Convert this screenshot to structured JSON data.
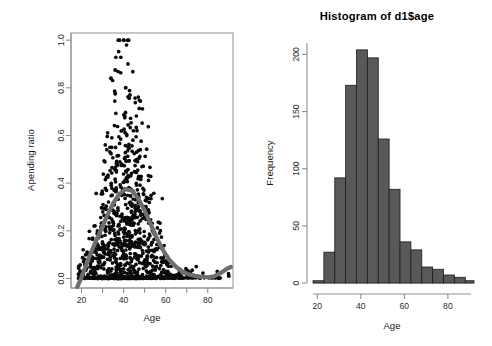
{
  "figure": {
    "width": 492,
    "height": 346,
    "background": "#ffffff",
    "panels": [
      "scatter-plot",
      "histogram"
    ]
  },
  "colors": {
    "point": "#0a0a0a",
    "loess_curve": "#6e6e6e",
    "bar_fill": "#595959",
    "bar_border": "#1c1c1c",
    "axis": "#8f8f8f",
    "text": "#1a1a1a"
  },
  "chart_data": [
    {
      "id": "scatter-plot",
      "type": "scatter",
      "title": "",
      "xlabel": "Age",
      "ylabel": "Apending ratio",
      "xlim": [
        15,
        92
      ],
      "ylim": [
        -0.04,
        1.03
      ],
      "xticks": [
        20,
        40,
        60,
        80
      ],
      "xminorticks": [
        30,
        50,
        70
      ],
      "yticks": [
        0.0,
        0.2,
        0.4,
        0.6,
        0.8,
        1.0
      ],
      "ytick_labels": [
        "0.0",
        "0.2",
        "0.4",
        "0.6",
        "0.8",
        "1.0"
      ],
      "grid": false,
      "legend": "none",
      "frame": "box",
      "n_points": 1100,
      "point_symbol": "filled-circle",
      "notes": "Dense black cloud of spending ratio vs age; peak density near age 35-45; many zero-ratio points along y=0; one outlier at (42, 1.00).",
      "overlay": {
        "type": "line",
        "name": "loess smoother",
        "color": "#6e6e6e",
        "linewidth": 4,
        "x": [
          18,
          20,
          23,
          26,
          29,
          32,
          35,
          38,
          41,
          44,
          47,
          50,
          53,
          56,
          59,
          62,
          65,
          68,
          71,
          74,
          77,
          80,
          83,
          86,
          89,
          91
        ],
        "y": [
          -0.035,
          0.005,
          0.075,
          0.14,
          0.2,
          0.26,
          0.315,
          0.355,
          0.375,
          0.368,
          0.335,
          0.285,
          0.225,
          0.165,
          0.115,
          0.075,
          0.048,
          0.028,
          0.017,
          0.011,
          0.007,
          0.005,
          0.009,
          0.022,
          0.04,
          0.048
        ]
      },
      "outliers": [
        {
          "x": 42,
          "y": 1.0
        },
        {
          "x": 36,
          "y": 0.875
        },
        {
          "x": 34,
          "y": 0.84
        },
        {
          "x": 41,
          "y": 0.8
        },
        {
          "x": 36,
          "y": 0.775
        },
        {
          "x": 43,
          "y": 0.77
        },
        {
          "x": 90,
          "y": 0.01
        }
      ]
    },
    {
      "id": "histogram",
      "type": "bar",
      "title": "Histogram of d1$age",
      "xlabel": "Age",
      "ylabel": "Frequency",
      "xlim": [
        18,
        92
      ],
      "ylim": [
        0,
        210
      ],
      "xticks": [
        20,
        40,
        60,
        80
      ],
      "yticks": [
        0,
        50,
        100,
        150,
        200
      ],
      "ytick_labels": [
        "0",
        "50",
        "100",
        "150",
        "200"
      ],
      "grid": false,
      "legend": "none",
      "frame": "L-axes",
      "binwidth": 5,
      "bin_edges": [
        18,
        23,
        28,
        33,
        38,
        43,
        48,
        53,
        58,
        63,
        68,
        73,
        78,
        83,
        88,
        92
      ],
      "categories": [
        "18-23",
        "23-28",
        "28-33",
        "33-38",
        "38-43",
        "43-48",
        "48-53",
        "53-58",
        "58-63",
        "63-68",
        "68-73",
        "73-78",
        "78-83",
        "83-88",
        "88-92"
      ],
      "values": [
        2,
        27,
        92,
        173,
        204,
        197,
        126,
        82,
        36,
        29,
        14,
        12,
        7,
        5,
        2
      ]
    }
  ]
}
